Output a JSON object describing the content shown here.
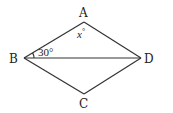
{
  "figure": {
    "shape": "rhombus",
    "vertices": {
      "A": {
        "label": "A",
        "x": 84,
        "y": 22
      },
      "B": {
        "label": "B",
        "x": 24,
        "y": 58
      },
      "C": {
        "label": "C",
        "x": 84,
        "y": 94
      },
      "D": {
        "label": "D",
        "x": 141,
        "y": 58
      }
    },
    "diagonal": "BD",
    "angles": {
      "angle_ABD": {
        "label": "30°"
      },
      "angle_A": {
        "var": "x",
        "deg": "°"
      }
    },
    "stroke_color": "#333333"
  }
}
